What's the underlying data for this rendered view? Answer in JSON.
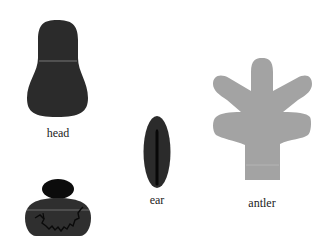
{
  "parts": {
    "head": {
      "label": "head",
      "color": "#2b2b2b"
    },
    "ear": {
      "label": "ear",
      "color": "#2b2b2b",
      "stripe_color": "#080808"
    },
    "antler": {
      "label": "antler",
      "color": "#a3a3a3"
    },
    "body": {
      "color": "#2f2f2f",
      "cap_color": "#0c0c0c",
      "crack_color": "#0a0a0a"
    }
  },
  "seam_color": "#8a8a8a"
}
